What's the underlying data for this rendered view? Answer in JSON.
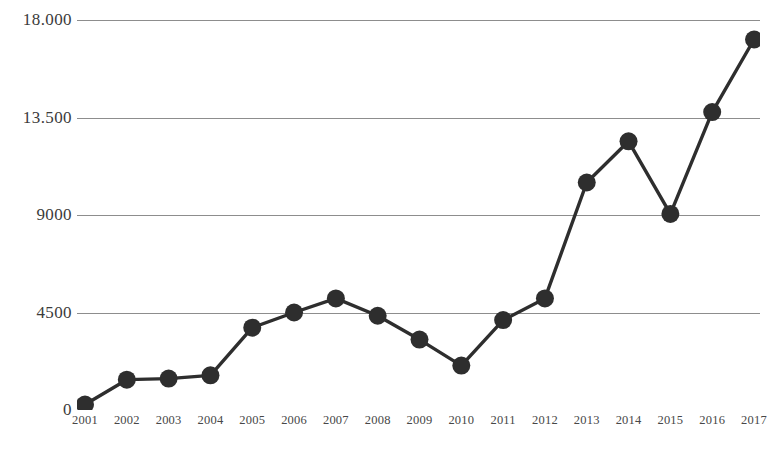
{
  "chart_data": {
    "type": "line",
    "title": "",
    "subtitle": "",
    "xlabel": "",
    "ylabel": "",
    "categories": [
      "2001",
      "2002",
      "2003",
      "2004",
      "2005",
      "2006",
      "2007",
      "2008",
      "2009",
      "2010",
      "2011",
      "2012",
      "2013",
      "2014",
      "2015",
      "2016",
      "2017"
    ],
    "x": [
      2001,
      2002,
      2003,
      2004,
      2005,
      2006,
      2007,
      2008,
      2009,
      2010,
      2011,
      2012,
      2013,
      2014,
      2015,
      2016,
      2017
    ],
    "values": [
      250,
      1400,
      1450,
      1600,
      3800,
      4500,
      5150,
      4350,
      3250,
      2050,
      4150,
      5150,
      10500,
      12400,
      9050,
      13750,
      17100
    ],
    "series": [
      {
        "name": "",
        "values": [
          250,
          1400,
          1450,
          1600,
          3800,
          4500,
          5150,
          4350,
          3250,
          2050,
          4150,
          5150,
          10500,
          12400,
          9050,
          13750,
          17100
        ]
      }
    ],
    "ylim": [
      0,
      18000
    ],
    "yticks": [
      0,
      4500,
      9000,
      13500,
      18000
    ],
    "ytick_labels": [
      "0",
      "4500",
      "9000",
      "13.500",
      "18.000"
    ],
    "xtick_labels": [
      "2001",
      "2002",
      "2003",
      "2004",
      "2005",
      "2006",
      "2007",
      "2008",
      "2009",
      "2010",
      "2011",
      "2012",
      "2013",
      "2014",
      "2015",
      "2016",
      "2017"
    ],
    "grid": true,
    "grid_axis": "y",
    "legend": false,
    "legend_position": "none",
    "marker": "circle",
    "marker_size": 9,
    "line_color": "#2e2e2e",
    "marker_color": "#2e2e2e",
    "grid_color": "#8d8d8d",
    "background_color": "#ffffff",
    "annotations": []
  }
}
